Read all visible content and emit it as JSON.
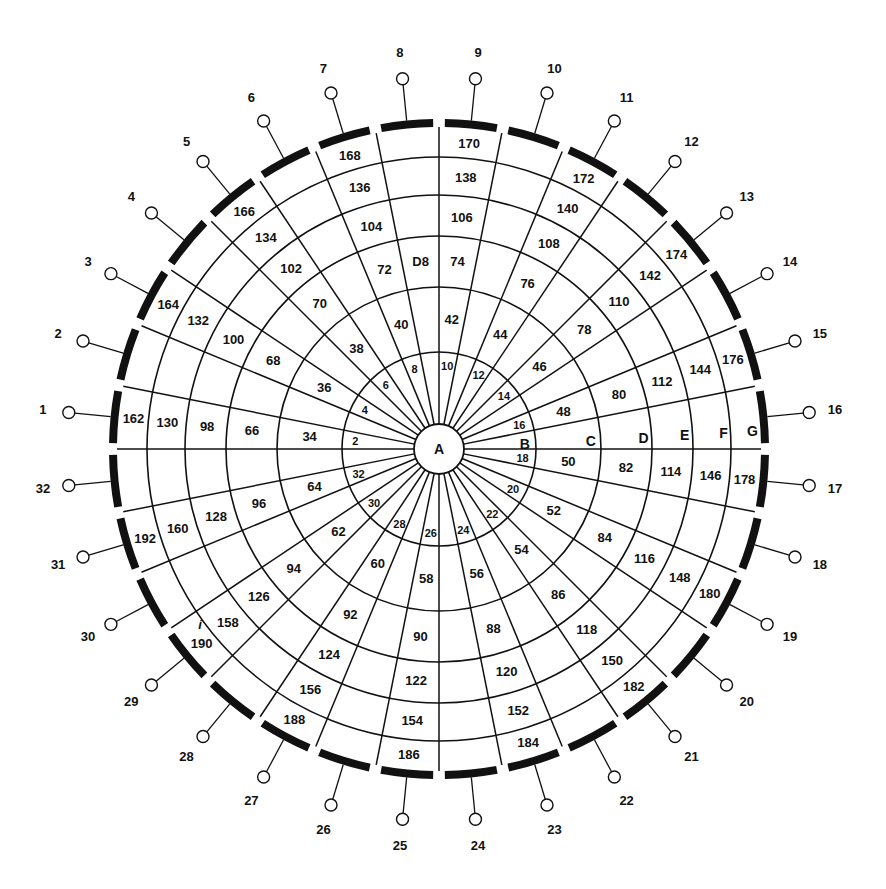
{
  "diagram": {
    "type": "concentric-sector-grid",
    "center_label": "A",
    "sector_count": 32,
    "colors": {
      "ink": "#111111",
      "background": "#ffffff"
    },
    "ring_letters": [
      "B",
      "C",
      "D",
      "E",
      "F",
      "G"
    ],
    "rings": [
      {
        "letter": "B",
        "values": {
          "1": "2",
          "3": "4",
          "5": "6",
          "7": "8",
          "9": "10",
          "11": "12",
          "13": "14",
          "15": "16",
          "17": "18",
          "19": "20",
          "21": "22",
          "23": "24",
          "25": "26",
          "27": "28",
          "29": "30",
          "31": "32"
        }
      },
      {
        "letter": "C",
        "values": {
          "1": "34",
          "3": "36",
          "5": "38",
          "7": "40",
          "9": "42",
          "11": "44",
          "13": "46",
          "15": "48",
          "17": "50",
          "19": "52",
          "21": "54",
          "23": "56",
          "25": "58",
          "27": "60",
          "29": "62",
          "31": "64"
        }
      },
      {
        "letter": "D",
        "values": {
          "1": "66",
          "3": "68",
          "5": "70",
          "7": "72",
          "8": "D8",
          "9": "74",
          "11": "76",
          "13": "78",
          "15": "80",
          "17": "82",
          "19": "84",
          "21": "86",
          "23": "88",
          "25": "90",
          "27": "92",
          "29": "94",
          "31": "96"
        }
      },
      {
        "letter": "E",
        "values": {
          "1": "98",
          "3": "100",
          "5": "102",
          "7": "104",
          "9": "106",
          "11": "108",
          "13": "110",
          "15": "112",
          "17": "114",
          "19": "116",
          "21": "118",
          "23": "120",
          "25": "122",
          "27": "124",
          "29": "126",
          "31": "128"
        }
      },
      {
        "letter": "F",
        "values": {
          "1": "130",
          "3": "132",
          "5": "134",
          "7": "136",
          "9": "138",
          "11": "140",
          "13": "142",
          "15": "144",
          "17": "146",
          "19": "148",
          "21": "150",
          "23": "152",
          "25": "154",
          "27": "156",
          "29": "158",
          "31": "160"
        }
      },
      {
        "letter": "G",
        "values": {
          "1": "162",
          "3": "164",
          "5": "166",
          "7": "168",
          "9": "170",
          "11": "172",
          "13": "174",
          "15": "176",
          "17": "178",
          "19": "180",
          "21": "182",
          "23": "184",
          "25": "186",
          "27": "188",
          "29": "190",
          "31": "192"
        }
      }
    ],
    "pins": [
      "1",
      "2",
      "3",
      "4",
      "5",
      "6",
      "7",
      "8",
      "9",
      "10",
      "11",
      "12",
      "13",
      "14",
      "15",
      "16",
      "17",
      "18",
      "19",
      "20",
      "21",
      "22",
      "23",
      "24",
      "25",
      "26",
      "27",
      "28",
      "29",
      "30",
      "31",
      "32"
    ],
    "stray_mark": "i"
  }
}
